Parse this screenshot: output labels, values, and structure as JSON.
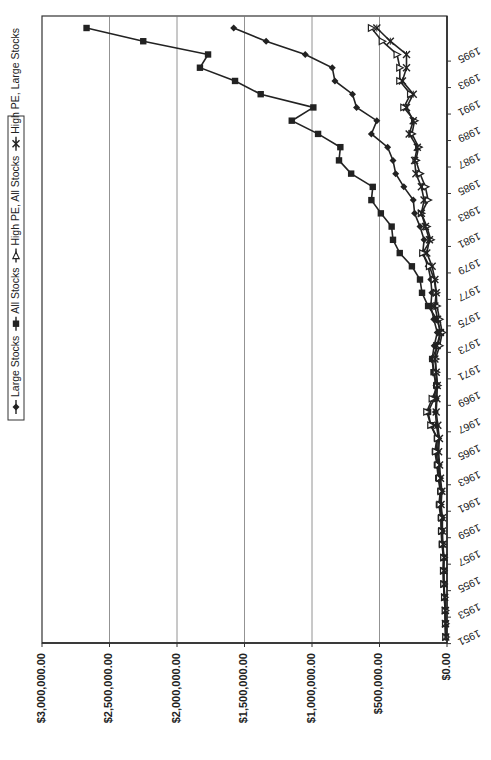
{
  "chart_data": {
    "type": "line",
    "orientation": "rotated-90-ccw",
    "title": "",
    "xlabel": "",
    "ylabel": "",
    "ylim": [
      0,
      3000000
    ],
    "grid": true,
    "legend_position": "left (top when unrotated)",
    "y_ticks": [
      "$0.00",
      "$500,000.00",
      "$1,000,000.00",
      "$1,500,000.00",
      "$2,000,000.00",
      "$2,500,000.00",
      "$3,000,000.00"
    ],
    "y_tick_values": [
      0,
      500000,
      1000000,
      1500000,
      2000000,
      2500000,
      3000000
    ],
    "x_tick_labels": [
      "1951",
      "1953",
      "1955",
      "1957",
      "1959",
      "1961",
      "1963",
      "1965",
      "1967",
      "1969",
      "1971",
      "1973",
      "1975",
      "1977",
      "1979",
      "1981",
      "1983",
      "1985",
      "1987",
      "1989",
      "1991",
      "1993",
      "1995"
    ],
    "x": [
      1951,
      1952,
      1953,
      1954,
      1955,
      1956,
      1957,
      1958,
      1959,
      1960,
      1961,
      1962,
      1963,
      1964,
      1965,
      1966,
      1967,
      1968,
      1969,
      1970,
      1971,
      1972,
      1973,
      1974,
      1975,
      1976,
      1977,
      1978,
      1979,
      1980,
      1981,
      1982,
      1983,
      1984,
      1985,
      1986,
      1987,
      1988,
      1989,
      1990,
      1991,
      1992,
      1993,
      1994,
      1995,
      1996,
      1997
    ],
    "series": [
      {
        "name": "Large Stocks",
        "marker": "diamond",
        "values": [
          10000,
          12000,
          13000,
          19000,
          25000,
          27000,
          25000,
          34000,
          38000,
          38000,
          48000,
          44000,
          54000,
          62000,
          70000,
          64000,
          78000,
          86000,
          80000,
          82000,
          94000,
          110000,
          95000,
          72000,
          98000,
          120000,
          112000,
          120000,
          140000,
          180000,
          170000,
          200000,
          240000,
          250000,
          320000,
          380000,
          400000,
          440000,
          560000,
          520000,
          670000,
          700000,
          830000,
          850000,
          1050000,
          1340000,
          1580000
        ]
      },
      {
        "name": "All Stocks",
        "marker": "square",
        "values": [
          10000,
          12000,
          14000,
          20000,
          26000,
          28000,
          26000,
          38000,
          44000,
          46000,
          60000,
          50000,
          65000,
          75000,
          90000,
          75000,
          120000,
          140000,
          95000,
          80000,
          100000,
          110000,
          70000,
          45000,
          75000,
          140000,
          185000,
          200000,
          260000,
          350000,
          400000,
          410000,
          490000,
          560000,
          550000,
          710000,
          800000,
          790000,
          955000,
          1150000,
          990000,
          1380000,
          1570000,
          1830000,
          1770000,
          2250000,
          2670000
        ]
      },
      {
        "name": "High PE, All Stocks",
        "marker": "triangle",
        "values": [
          9000,
          11000,
          13000,
          18000,
          24000,
          26000,
          24000,
          34000,
          40000,
          40000,
          52000,
          44000,
          56000,
          66000,
          84000,
          70000,
          120000,
          150000,
          110000,
          70000,
          80000,
          85000,
          55000,
          35000,
          55000,
          75000,
          80000,
          95000,
          130000,
          180000,
          120000,
          150000,
          190000,
          140000,
          160000,
          200000,
          230000,
          210000,
          260000,
          240000,
          320000,
          270000,
          350000,
          350000,
          370000,
          480000,
          560000
        ]
      },
      {
        "name": "High PE, Large Stocks",
        "marker": "x",
        "values": [
          9000,
          11000,
          12000,
          17000,
          22000,
          24000,
          22000,
          30000,
          34000,
          34000,
          44000,
          38000,
          48000,
          55000,
          62000,
          56000,
          68000,
          80000,
          75000,
          72000,
          80000,
          90000,
          75000,
          50000,
          70000,
          90000,
          80000,
          90000,
          110000,
          150000,
          130000,
          160000,
          190000,
          170000,
          190000,
          230000,
          240000,
          220000,
          280000,
          250000,
          300000,
          250000,
          330000,
          300000,
          300000,
          420000,
          520000
        ]
      }
    ]
  }
}
